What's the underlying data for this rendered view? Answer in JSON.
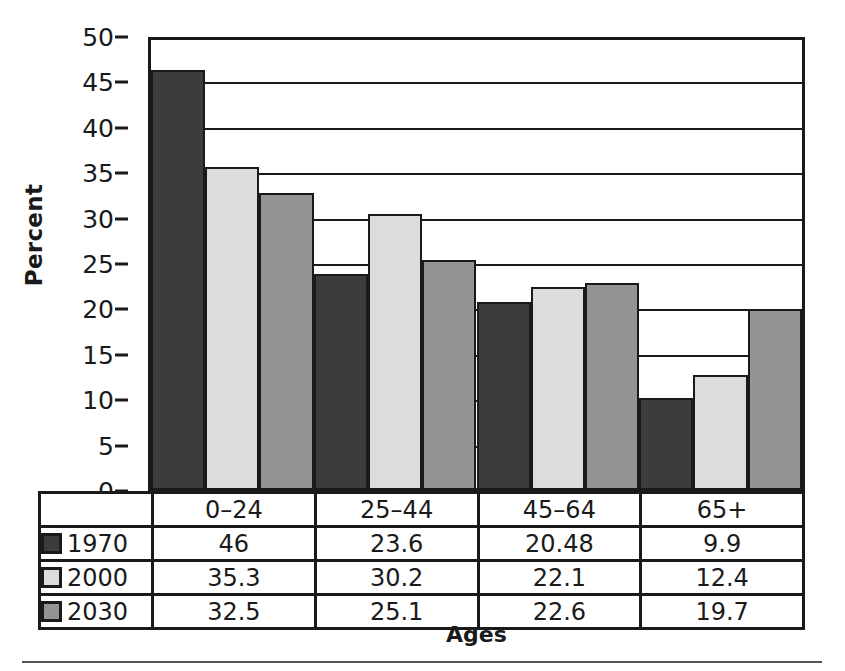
{
  "chart_data": {
    "type": "bar",
    "title": "",
    "subtitle": "",
    "xlabel": "Ages",
    "ylabel": "Percent",
    "categories": [
      "0–24",
      "25–44",
      "45–64",
      "65+"
    ],
    "series": [
      {
        "name": "1970",
        "color": "#3c3c3c",
        "values": [
          46,
          23.6,
          20.48,
          9.9
        ]
      },
      {
        "name": "2000",
        "color": "#dcdcdc",
        "values": [
          35.3,
          30.2,
          22.1,
          12.4
        ]
      },
      {
        "name": "2030",
        "color": "#949494",
        "values": [
          32.5,
          25.1,
          22.6,
          19.7
        ]
      }
    ],
    "ylim": [
      0,
      50
    ],
    "ytick_values": [
      0,
      5,
      10,
      15,
      20,
      25,
      30,
      35,
      40,
      45,
      50
    ],
    "ytick_labels": [
      "0",
      "5",
      "10",
      "15",
      "20",
      "25",
      "30",
      "35",
      "40",
      "45",
      "50"
    ],
    "grid": "horizontal",
    "legend_position": "table-below",
    "data_table": {
      "header": [
        "",
        "0–24",
        "25–44",
        "45–64",
        "65+"
      ],
      "rows": [
        {
          "label": "1970",
          "cells": [
            "46",
            "23.6",
            "20.48",
            "9.9"
          ]
        },
        {
          "label": "2000",
          "cells": [
            "35.3",
            "30.2",
            "22.1",
            "12.4"
          ]
        },
        {
          "label": "2030",
          "cells": [
            "32.5",
            "25.1",
            "22.6",
            "19.7"
          ]
        }
      ]
    }
  }
}
